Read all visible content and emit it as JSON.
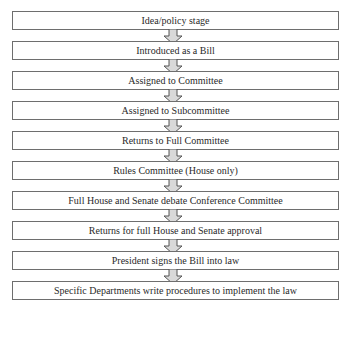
{
  "diagram": {
    "type": "flowchart",
    "direction": "top-to-bottom",
    "steps": [
      {
        "label": "Idea/policy stage"
      },
      {
        "label": "Introduced as a Bill"
      },
      {
        "label": "Assigned to Committee"
      },
      {
        "label": "Assigned to Subcommittee"
      },
      {
        "label": "Returns to Full Committee"
      },
      {
        "label": "Rules Committee (House only)"
      },
      {
        "label": "Full House and Senate debate Conference Committee"
      },
      {
        "label": "Returns for full House and Senate approval"
      },
      {
        "label": "President signs the Bill into law"
      },
      {
        "label": "Specific Departments write procedures to implement the law"
      }
    ],
    "connector_icon": "hollow-down-arrow-icon",
    "colors": {
      "box_border": "#6e6e6e",
      "arrow_fill": "#d9d9d9",
      "arrow_stroke": "#555555",
      "text": "#2a2a2a"
    }
  }
}
